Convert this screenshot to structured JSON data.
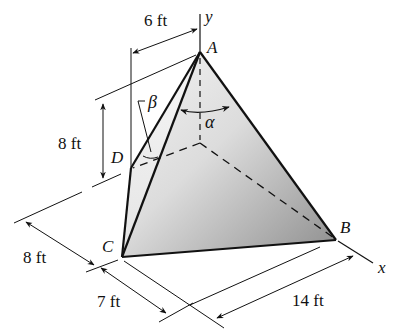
{
  "figure": {
    "type": "3D tetrahedron statics diagram",
    "vertices": {
      "A": {
        "label": "A"
      },
      "B": {
        "label": "B"
      },
      "C": {
        "label": "C"
      },
      "D": {
        "label": "D"
      }
    },
    "axes": {
      "x": {
        "label": "x"
      },
      "y": {
        "label": "y"
      }
    },
    "angles": {
      "alpha": {
        "label": "α"
      },
      "beta": {
        "label": "β"
      }
    },
    "dimensions": {
      "top_width": {
        "label": "6 ft"
      },
      "D_height": {
        "label": "8 ft"
      },
      "left_depth": {
        "label": "8 ft"
      },
      "bottom_left": {
        "label": "7 ft"
      },
      "bottom_right": {
        "label": "14 ft"
      }
    },
    "colors": {
      "line": "#111111",
      "face_light": "#f2f2f2",
      "face_dark": "#9a9a9a"
    }
  }
}
